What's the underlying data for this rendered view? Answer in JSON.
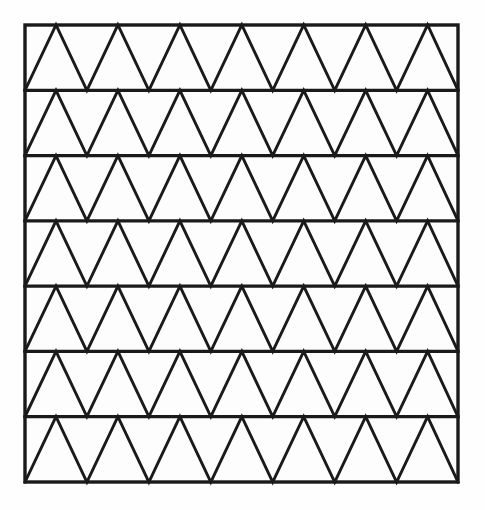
{
  "figure": {
    "background_color": "#fefefe",
    "panel_fill": "#fdfdfd",
    "line_color": "#1a1a1a",
    "frame": {
      "x": 25,
      "y": 25,
      "width": 433,
      "height": 457,
      "stroke_width": 3.4
    },
    "grid": {
      "row_count": 7,
      "row_height": 65.3,
      "triangles_per_row": 7,
      "triangle_base": 61.9,
      "apex_offset": 31.0,
      "divider_stroke_width": 3.2,
      "zig_stroke_width": 2.9,
      "row_tops": [
        25,
        90.3,
        155.6,
        220.9,
        286.1,
        351.4,
        416.7
      ],
      "row_bottoms": [
        90.3,
        155.6,
        220.9,
        286.1,
        351.4,
        416.7,
        482
      ],
      "apex_x_positions": [
        56,
        117.9,
        179.9,
        241.8,
        303.7,
        365.7,
        427.6
      ],
      "valley_x_positions": [
        25,
        86.9,
        148.9,
        210.8,
        272.7,
        334.7,
        396.6,
        458
      ]
    },
    "labels": {
      "figure_caption": "",
      "axis_label": ""
    }
  },
  "chart_data": {
    "type": "diagram",
    "rows": 7,
    "triangles_per_row": 7,
    "total_triangles": 49,
    "orientation": "all triangles point upward",
    "row_labels": [
      "row 1",
      "row 2",
      "row 3",
      "row 4",
      "row 5",
      "row 6",
      "row 7"
    ]
  }
}
